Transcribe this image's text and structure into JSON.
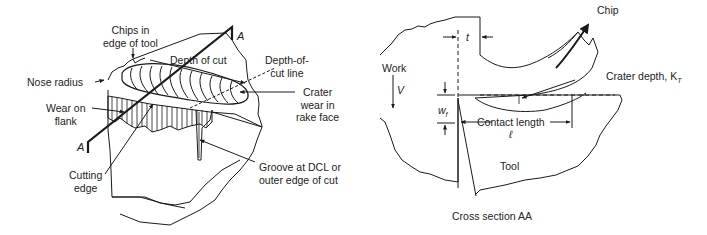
{
  "figure": {
    "left_panel": {
      "name": "tool-wear-perspective-view",
      "labels": {
        "chips_in_edge": "Chips in\nedge of tool",
        "chips_in_edge_line1": "Chips in",
        "chips_in_edge_line2": "edge of tool",
        "depth_of_cut": "Depth of cut",
        "depth_of_cut_line_1": "Depth-of-",
        "depth_of_cut_line_2": "cut line",
        "nose_radius": "Nose radius",
        "wear_on_flank_1": "Wear on",
        "wear_on_flank_2": "flank",
        "crater_wear_1": "Crater",
        "crater_wear_2": "wear in",
        "crater_wear_3": "rake face",
        "cutting_edge_1": "Cutting",
        "cutting_edge_2": "edge",
        "groove_1": "Groove at DCL or",
        "groove_2": "outer edge of cut",
        "section_marker_top": "A",
        "section_marker_bottom": "A"
      }
    },
    "right_panel": {
      "name": "cross-section-aa",
      "labels": {
        "chip": "Chip",
        "t": "t",
        "work": "Work",
        "velocity": "V",
        "crater_depth": "Crater depth, K",
        "crater_depth_sub": "T",
        "wf": "w",
        "wf_sub": "f",
        "contact_length": "Contact length",
        "contact_length_symbol": "ℓ",
        "tool": "Tool",
        "caption": "Cross section AA"
      }
    },
    "colors": {
      "line": "#1a1a1a",
      "text": "#222222",
      "background": "#ffffff"
    }
  }
}
